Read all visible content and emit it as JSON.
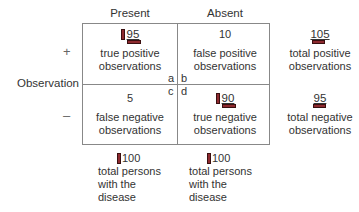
{
  "columns": {
    "present": "Present",
    "absent": "Absent"
  },
  "rows": {
    "label": "Observation",
    "positive_sign": "+",
    "negative_sign": "–"
  },
  "cells": {
    "a": {
      "value": "95",
      "text": [
        "true positive",
        "observations"
      ],
      "corner": "a",
      "marker": "vertical-and-horizontal"
    },
    "b": {
      "value": "10",
      "text": [
        "false positive",
        "observations"
      ],
      "corner": "b"
    },
    "c": {
      "value": "5",
      "text": [
        "false negative",
        "observations"
      ],
      "corner": "c"
    },
    "d": {
      "value": "90",
      "text": [
        "true negative",
        "observations"
      ],
      "corner": "d",
      "marker": "vertical-and-horizontal"
    }
  },
  "row_totals": {
    "positive": {
      "value": "105",
      "text": [
        "total positive",
        "observations"
      ]
    },
    "negative": {
      "value": "95",
      "text": [
        "total negative",
        "observations"
      ]
    }
  },
  "column_totals": {
    "present": {
      "value": "100",
      "text": [
        "total persons",
        "with the",
        "disease"
      ]
    },
    "absent": {
      "value": "100",
      "text": [
        "total persons",
        "with the",
        "disease"
      ]
    }
  },
  "colors": {
    "marker_fill": "#8e2a2f",
    "marker_border": "#3a0f10",
    "grid_line": "#888888",
    "text": "#333333"
  }
}
